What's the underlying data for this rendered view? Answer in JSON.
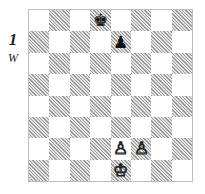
{
  "diagram": {
    "number": "1",
    "side_to_move": "W",
    "orientation": "white-bottom",
    "files": [
      "a",
      "b",
      "c",
      "d",
      "e",
      "f",
      "g",
      "h"
    ],
    "ranks": [
      "8",
      "7",
      "6",
      "5",
      "4",
      "3",
      "2",
      "1"
    ],
    "pieces": [
      {
        "square": "d8",
        "color": "black",
        "type": "king",
        "glyph": "♚"
      },
      {
        "square": "e7",
        "color": "black",
        "type": "pawn",
        "glyph": "♟"
      },
      {
        "square": "e2",
        "color": "white",
        "type": "pawn",
        "glyph": "♙"
      },
      {
        "square": "f2",
        "color": "white",
        "type": "pawn",
        "glyph": "♙"
      },
      {
        "square": "e1",
        "color": "white",
        "type": "king",
        "glyph": "♔"
      }
    ],
    "colors": {
      "light": "#ffffff",
      "dark": "#b8b8b8 (hatched)",
      "border": "#bdbdbd"
    }
  }
}
